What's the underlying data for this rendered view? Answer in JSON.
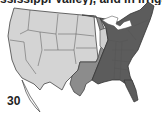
{
  "document": {
    "caption_fragment": "ssissippi Valley), and in irrigate",
    "figure_number": "30"
  },
  "map": {
    "subject": "United States regional map",
    "regions": [
      {
        "name": "west",
        "shade": "light",
        "color": "#d4d4d4"
      },
      {
        "name": "central-band",
        "shade": "medium",
        "color": "#8c8c8c"
      },
      {
        "name": "east",
        "shade": "dark",
        "color": "#5c5c5c"
      }
    ],
    "border_color": "#333333",
    "water_color": "#ffffff"
  }
}
